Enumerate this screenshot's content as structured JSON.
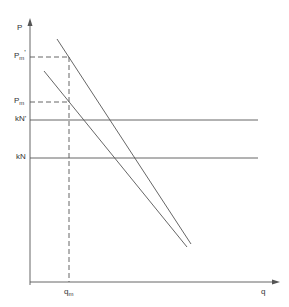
{
  "diagram": {
    "y_axis_label": "P",
    "x_axis_label": "q",
    "labels": {
      "pm_prime": {
        "main": "P",
        "sub": "m",
        "sup": "'"
      },
      "pm": {
        "main": "P",
        "sub": "m"
      },
      "kn_prime": "kN'",
      "kn": "kN",
      "qm": {
        "main": "q",
        "sub": "m"
      }
    },
    "colors": {
      "line": "#555555",
      "text": "#333333",
      "background": "#ffffff"
    },
    "lines": {
      "demand_upper": {
        "x1": 57,
        "y1": 39,
        "x2": 191,
        "y2": 244
      },
      "demand_lower": {
        "x1": 44,
        "y1": 71,
        "x2": 187,
        "y2": 247
      },
      "kn_prime_level": {
        "y": 120,
        "x_end": 258
      },
      "kn_level": {
        "y": 158,
        "x_end": 258
      }
    }
  }
}
